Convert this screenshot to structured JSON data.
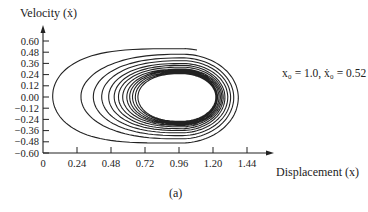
{
  "chart_data": {
    "type": "line",
    "title": "",
    "caption": "(a)",
    "xlabel": "Displacement (x)",
    "ylabel": "Velocity (ẋ)",
    "xlim": [
      0,
      1.6
    ],
    "ylim": [
      -0.6,
      0.6
    ],
    "x_ticks": [
      "0",
      "0.24",
      "0.48",
      "0.72",
      "0.96",
      "1.20",
      "1.44"
    ],
    "x_tick_values": [
      0,
      0.24,
      0.48,
      0.72,
      0.96,
      1.2,
      1.44
    ],
    "y_ticks": [
      "0.60",
      "0.48",
      "0.36",
      "0.24",
      "0.12",
      "0.00",
      "−0.12",
      "−0.24",
      "−0.36",
      "−0.48",
      "−0.60"
    ],
    "y_tick_values": [
      0.6,
      0.48,
      0.36,
      0.24,
      0.12,
      0.0,
      -0.12,
      -0.24,
      -0.36,
      -0.48,
      -0.6
    ],
    "grid": false,
    "legend": null,
    "annotation": "x₀ = 1.0, ẋ₀ = 0.52",
    "series": [
      {
        "name": "phase trajectory (inward spiral to limit cycle)",
        "start": {
          "x": 1.0,
          "y": 0.52
        },
        "loops": 13,
        "left_extremes_x": [
          0.05,
          0.26,
          0.35,
          0.41,
          0.46,
          0.5,
          0.53,
          0.56,
          0.59,
          0.61,
          0.63,
          0.65,
          0.67
        ],
        "right_extremes_x": [
          1.41,
          1.37,
          1.34,
          1.32,
          1.3,
          1.28,
          1.27,
          1.26,
          1.25,
          1.24,
          1.23,
          1.225,
          1.22
        ],
        "top_extremes_y": [
          0.52,
          0.46,
          0.42,
          0.39,
          0.36,
          0.34,
          0.32,
          0.3,
          0.29,
          0.28,
          0.27,
          0.26,
          0.25
        ],
        "bottom_extremes_y": [
          -0.52,
          -0.47,
          -0.43,
          -0.4,
          -0.37,
          -0.35,
          -0.33,
          -0.31,
          -0.3,
          -0.29,
          -0.28,
          -0.27,
          -0.26
        ],
        "center_x": 0.98
      }
    ]
  },
  "labels": {
    "ylabel": "Velocity (ẋ)",
    "xlabel": "Displacement (x)",
    "caption": "(a)",
    "annotation": "x₀ = 1.0, ẋ₀ = 0.52"
  },
  "colors": {
    "line": "#222222",
    "axis": "#222222",
    "text": "#222222",
    "background": "#ffffff"
  }
}
